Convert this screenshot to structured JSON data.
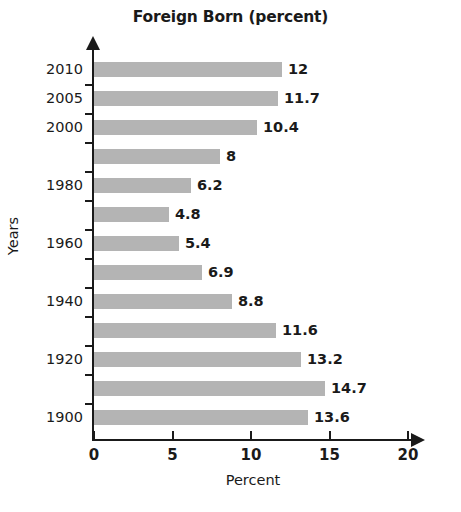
{
  "chart_data": {
    "type": "bar",
    "orientation": "horizontal",
    "title": "Foreign Born (percent)",
    "xlabel": "Percent",
    "ylabel": "Years",
    "xlim": [
      0,
      20
    ],
    "grid": false,
    "legend": null,
    "categories": [
      "2010",
      "2005",
      "2000",
      "1990",
      "1980",
      "1970",
      "1960",
      "1950",
      "1940",
      "1930",
      "1920",
      "1910",
      "1900"
    ],
    "visible_category_labels": [
      "2010",
      "2005",
      "2000",
      "",
      "1980",
      "",
      "1960",
      "",
      "1940",
      "",
      "1920",
      "",
      "1900"
    ],
    "values": [
      12,
      11.7,
      10.4,
      8,
      6.2,
      4.8,
      5.4,
      6.9,
      8.8,
      11.6,
      13.2,
      14.7,
      13.6
    ],
    "value_labels": [
      "12",
      "11.7",
      "10.4",
      "8",
      "6.2",
      "4.8",
      "5.4",
      "6.9",
      "8.8",
      "11.6",
      "13.2",
      "14.7",
      "13.6"
    ],
    "xticks": [
      0,
      5,
      10,
      15,
      20
    ],
    "xtick_labels": [
      "0",
      "5",
      "10",
      "15",
      "20"
    ],
    "bar_color": "#b4b4b4",
    "axis_color": "#1a1a1a",
    "text_color": "#1a1a1a"
  }
}
